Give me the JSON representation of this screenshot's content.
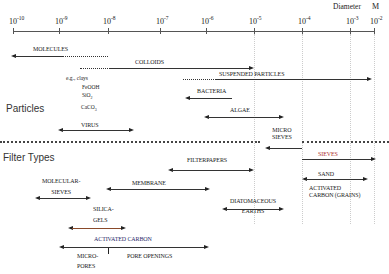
{
  "axis": {
    "title": "Diameter",
    "unit": "M",
    "ticks": [
      {
        "base": "10",
        "exp": "-10"
      },
      {
        "base": "10",
        "exp": "-9"
      },
      {
        "base": "10",
        "exp": "-8"
      },
      {
        "base": "10",
        "exp": "-7"
      },
      {
        "base": "10",
        "exp": "-6"
      },
      {
        "base": "10",
        "exp": "-5"
      },
      {
        "base": "10",
        "exp": "-4"
      },
      {
        "base": "10",
        "exp": "-3"
      },
      {
        "base": "10",
        "exp": "-2"
      }
    ]
  },
  "sections": {
    "particles": "Particles",
    "filter_types": "Filter Types"
  },
  "particles": {
    "molecules": "MOLECULES",
    "colloids": "COLLOIDS",
    "colloid_examples": {
      "eg": "e.g.,",
      "clays": "clays",
      "feooh": "FeOOH",
      "sio2_base": "SiO",
      "sio2_sub": "2",
      "caco3_base": "CaCO",
      "caco3_sub": "3"
    },
    "suspended": "SUSPENDED PARTICLES",
    "bacteria": "BACTERIA",
    "algae": "ALGAE",
    "virus": "VIRUS"
  },
  "filters": {
    "micro_sieves_1": "MICRO",
    "micro_sieves_2": "SIEVES",
    "sieves": "SIEVES",
    "filterpapers": "FILTERPAPERS",
    "molecular_sieves_1": "MOLECULAR-",
    "molecular_sieves_2": "SIEVES",
    "membrane": "MEMBRANE",
    "sand": "SAND",
    "activated_grains_1": "ACTIVATED",
    "activated_grains_2": "CARBON  (GRAINS)",
    "silica_1": "SILICA-",
    "silica_2": "GELS",
    "diatom_1": "DIATOMACEOUS",
    "diatom_2": "EARTHS",
    "activated_carbon": "ACTIVATED CARBON",
    "micropores_1": "MICRO-",
    "micropores_2": "PORES",
    "pore_openings": "PORE OPENINGS"
  },
  "colors": {
    "sieves_label": "#b03030",
    "activated_carbon_label": "#2a2a6a",
    "silica_line": "#8a4a2a"
  }
}
